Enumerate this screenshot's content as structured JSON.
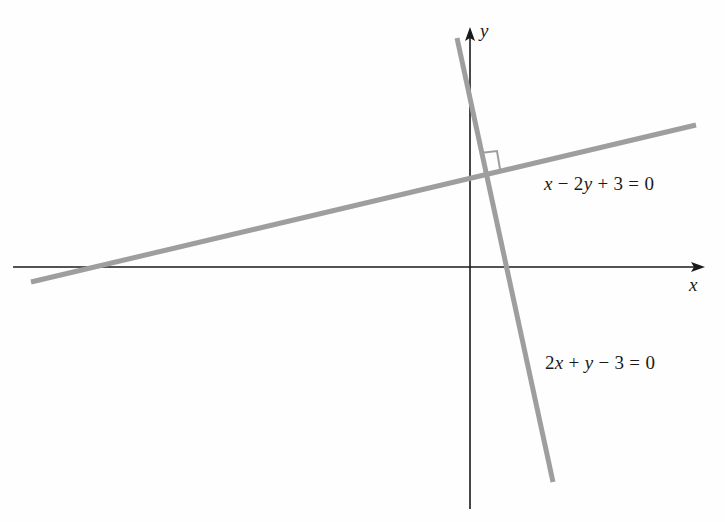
{
  "figure": {
    "axes": {
      "x_label": "x",
      "y_label": "y",
      "origin_px": [
        470,
        267
      ]
    },
    "lines": [
      {
        "name": "line-1",
        "equation": "x − 2y + 3 = 0",
        "equation_parts": [
          "x",
          " − 2",
          "y",
          " + 3 = 0"
        ],
        "color": "#9e9e9e",
        "slope": 0.5
      },
      {
        "name": "line-2",
        "equation": "2x + y − 3 = 0",
        "equation_parts": [
          "2",
          "x",
          " + ",
          "y",
          " − 3 = 0"
        ],
        "color": "#9e9e9e",
        "slope": -2
      }
    ],
    "annotation": {
      "right_angle_marker": true,
      "meaning": "perpendicular lines"
    },
    "colors": {
      "axis": "#1a1a1a",
      "line": "#9e9e9e",
      "background": "#fefefe"
    }
  }
}
